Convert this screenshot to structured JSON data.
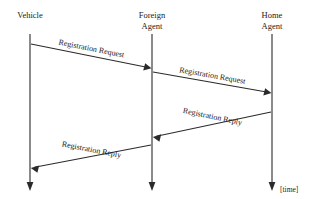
{
  "diagram": {
    "type": "sequence-diagram",
    "background_color": "#ffffff",
    "line_color": "#2a2a2a",
    "width": 319,
    "height": 199,
    "time_annotation": "[time]",
    "participants": [
      {
        "id": "vehicle",
        "label_line1": "Vehicle",
        "label_line2": "",
        "x": 30
      },
      {
        "id": "foreign-agent",
        "label_line1": "Foreign",
        "label_line2": "Agent",
        "x": 152
      },
      {
        "id": "home-agent",
        "label_line1": "Home",
        "label_line2": "Agent",
        "x": 272
      }
    ],
    "messages": [
      {
        "id": "msg-1",
        "label": "Registration Request",
        "from": "vehicle",
        "to": "foreign-agent",
        "direction": "right",
        "x1": 31,
        "y1": 44,
        "x2": 151,
        "y2": 68,
        "label_x": 91,
        "label_y": 51,
        "label_angle": 11.3
      },
      {
        "id": "msg-2",
        "label": "Registration Request",
        "from": "foreign-agent",
        "to": "home-agent",
        "direction": "right",
        "x1": 153,
        "y1": 72,
        "x2": 271,
        "y2": 93,
        "label_x": 212,
        "label_y": 78,
        "label_angle": 10.1
      },
      {
        "id": "msg-3",
        "label": "Registration Reply",
        "from": "home-agent",
        "to": "foreign-agent",
        "direction": "left",
        "x1": 271,
        "y1": 112,
        "x2": 153,
        "y2": 137,
        "label_x": 212,
        "label_y": 119,
        "label_angle": 11.9
      },
      {
        "id": "msg-4",
        "label": "Registration Reply",
        "from": "foreign-agent",
        "to": "vehicle",
        "direction": "left",
        "x1": 151,
        "y1": 145,
        "x2": 31,
        "y2": 168,
        "label_x": 91,
        "label_y": 152,
        "label_angle": 10.9
      }
    ]
  }
}
